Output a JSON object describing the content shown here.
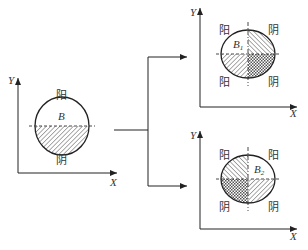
{
  "diagram": {
    "type": "yin-yang decomposition of B",
    "colors": {
      "stroke": "#333333",
      "background": "#ffffff"
    },
    "left": {
      "axis_x_label": "X",
      "axis_y_label": "Y",
      "region_label": "B",
      "top_label": "阳",
      "bottom_label": "阴",
      "shaded": "lower-half"
    },
    "top_right": {
      "axis_x_label": "X",
      "axis_y_label": "Y",
      "region_label": "B",
      "region_sub": "1",
      "labels": {
        "upper_left": "阳",
        "upper_right": "阴",
        "lower_left": "阳",
        "lower_right": "阴"
      },
      "fills": {
        "upper_left": "none",
        "upper_right": "hatch",
        "lower_left": "hatch",
        "lower_right": "crosshatch"
      }
    },
    "bottom_right": {
      "axis_x_label": "X",
      "axis_y_label": "Y",
      "region_label": "B",
      "region_sub": "2",
      "labels": {
        "upper_left": "阳",
        "upper_right": "阳",
        "lower_left": "阴",
        "lower_right": "阴"
      },
      "fills": {
        "upper_left": "hatch",
        "upper_right": "none",
        "lower_left": "crosshatch",
        "lower_right": "hatch"
      }
    },
    "connector": {
      "from": "left",
      "to": [
        "top_right",
        "bottom_right"
      ]
    }
  }
}
